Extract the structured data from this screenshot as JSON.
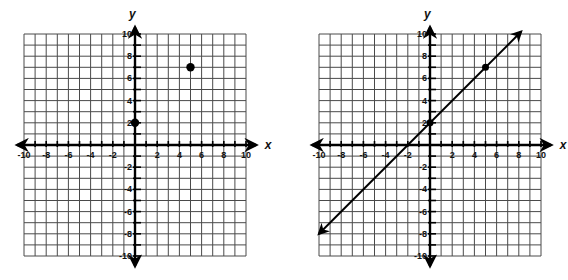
{
  "graphs": [
    {
      "name": "points-graph",
      "origin_px": [
        135,
        145
      ],
      "cell_px": 11.1,
      "x_axis_label": "x",
      "y_axis_label": "y",
      "x_tick_labels": [
        "-10",
        "-8",
        "-6",
        "-4",
        "-2",
        "2",
        "4",
        "6",
        "8",
        "10"
      ],
      "y_tick_labels": [
        "10",
        "8",
        "6",
        "4",
        "2",
        "-2",
        "-4",
        "-6",
        "-8",
        "-10"
      ]
    },
    {
      "name": "line-graph",
      "origin_px": [
        430,
        145
      ],
      "cell_px": 11.1,
      "x_axis_label": "x",
      "y_axis_label": "y",
      "x_tick_labels": [
        "-10",
        "-8",
        "-6",
        "-4",
        "-2",
        "2",
        "4",
        "6",
        "8",
        "10"
      ],
      "y_tick_labels": [
        "10",
        "8",
        "6",
        "4",
        "2",
        "-2",
        "-4",
        "-6",
        "-8",
        "-10"
      ]
    }
  ],
  "chart_data": [
    {
      "type": "scatter",
      "title": "",
      "xlabel": "x",
      "ylabel": "y",
      "xlim": [
        -10,
        10
      ],
      "ylim": [
        -10,
        10
      ],
      "grid": true,
      "points": [
        {
          "x": 0,
          "y": 2
        },
        {
          "x": 5,
          "y": 7
        }
      ]
    },
    {
      "type": "line",
      "title": "",
      "xlabel": "x",
      "ylabel": "y",
      "xlim": [
        -10,
        10
      ],
      "ylim": [
        -10,
        10
      ],
      "grid": true,
      "equation": "y = x + 2",
      "slope": 1,
      "intercept": 2,
      "points": [
        {
          "x": 0,
          "y": 2
        },
        {
          "x": 5,
          "y": 7
        }
      ],
      "line_endpoints": [
        {
          "x": -10,
          "y": -8
        },
        {
          "x": 8.2,
          "y": 10.2
        }
      ],
      "arrows_both_ends": true
    }
  ]
}
